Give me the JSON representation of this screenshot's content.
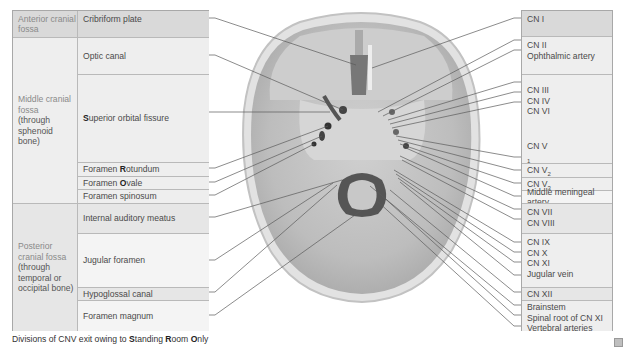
{
  "left_table": {
    "regions": [
      {
        "label": "Anterior cranial fossa",
        "sub": ""
      },
      {
        "label": "Middle cranial fossa",
        "sub": "(through sphenoid bone)"
      },
      {
        "label": "Posterior cranial fossa",
        "sub": "(through temporal or occipital bone)"
      }
    ],
    "openings": [
      {
        "pre": "",
        "key": "",
        "post": "Cribriform plate"
      },
      {
        "pre": "",
        "key": "",
        "post": "Optic canal"
      },
      {
        "pre": "",
        "key": "S",
        "post": "uperior orbital fissure"
      },
      {
        "pre": "Foramen ",
        "key": "R",
        "post": "otundum"
      },
      {
        "pre": "Foramen ",
        "key": "O",
        "post": "vale"
      },
      {
        "pre": "",
        "key": "",
        "post": "Foramen spinosum"
      },
      {
        "pre": "",
        "key": "",
        "post": "Internal auditory meatus"
      },
      {
        "pre": "",
        "key": "",
        "post": "Jugular foramen"
      },
      {
        "pre": "",
        "key": "",
        "post": "Hypoglossal canal"
      },
      {
        "pre": "",
        "key": "",
        "post": "Foramen magnum"
      }
    ]
  },
  "right_table": {
    "groups": [
      [
        "CN I"
      ],
      [
        "CN II",
        "Ophthalmic artery"
      ],
      [
        "CN III",
        "CN IV",
        "CN VI"
      ],
      [
        "CN V1"
      ],
      [
        "CN V2"
      ],
      [
        "CN V3"
      ],
      [
        "Middle meningeal artery"
      ],
      [
        "CN VII",
        "CN VIII"
      ],
      [
        "CN IX",
        "CN X",
        "CN XI",
        "Jugular vein"
      ],
      [
        "CN XII"
      ],
      [
        "Brainstem",
        "Spinal root of CN XI",
        "Vertebral arteries"
      ]
    ],
    "cnv": {
      "base": "CN V",
      "subs": [
        "1",
        "2",
        "3"
      ]
    }
  },
  "footnote": {
    "pre": "Divisions of CNV exit owing to ",
    "k1": "S",
    "w1": "tanding ",
    "k2": "R",
    "w2": "oom ",
    "k3": "O",
    "w3": "nly"
  },
  "image": {
    "alt": "Skull base, superior view, showing foramina"
  }
}
